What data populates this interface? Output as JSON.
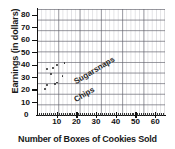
{
  "chart_data": {
    "type": "scatter",
    "title": "",
    "xlabel": "Number of Boxes of Cookies Sold",
    "ylabel": "Earnings (in dollars)",
    "xlim": [
      0,
      65
    ],
    "ylim": [
      0,
      85
    ],
    "xticks": [
      0,
      10,
      20,
      30,
      40,
      50,
      60
    ],
    "yticks": [
      0,
      10,
      20,
      30,
      40,
      50,
      60,
      70,
      80
    ],
    "grid": true,
    "legend": "inline-annotations",
    "annotations": [
      {
        "text": "Sugarsnaps",
        "x": 5,
        "y": 42,
        "rotation": -31
      },
      {
        "text": "Chips",
        "x": 5,
        "y": 29,
        "rotation": -31
      }
    ],
    "series": [
      {
        "name": "Sugarsnaps",
        "points": [
          {
            "x": 5,
            "y": 37
          },
          {
            "x": 8,
            "y": 38
          },
          {
            "x": 10,
            "y": 40
          },
          {
            "x": 14,
            "y": 42
          }
        ]
      },
      {
        "name": "Chips",
        "points": [
          {
            "x": 4,
            "y": 21
          },
          {
            "x": 5,
            "y": 24
          },
          {
            "x": 7,
            "y": 33
          },
          {
            "x": 9,
            "y": 25
          },
          {
            "x": 10,
            "y": 26
          },
          {
            "x": 13,
            "y": 31
          }
        ]
      }
    ]
  },
  "axis": {
    "y_title": "Earnings (in dollars)",
    "x_title": "Number of Boxes of Cookies Sold",
    "y_labels": [
      "80",
      "70",
      "60",
      "50",
      "40",
      "30",
      "20",
      "10"
    ],
    "x_labels": [
      "10",
      "20",
      "30",
      "40",
      "50",
      "60"
    ],
    "origin_label": "0"
  },
  "series_labels": {
    "upper": "Sugarsnaps",
    "lower": "Chips"
  },
  "colors": {
    "point": "#2b2b2b",
    "axis": "#111111",
    "grid_major": "#5a5a64",
    "grid_minor": "#9696a0",
    "background": "#ffffff",
    "text": "#1a1a1a"
  }
}
